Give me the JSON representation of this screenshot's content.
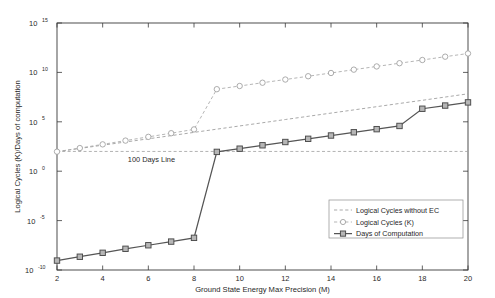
{
  "chart_data": {
    "type": "line",
    "title": "",
    "xlabel": "Ground State Energy Max Precision (M)",
    "ylabel": "Logical Cycles (K)/Days of computation",
    "xlim": [
      2,
      20
    ],
    "ylim": [
      1e-10,
      1000000000000000.0
    ],
    "yscale": "log",
    "xticks": [
      2,
      4,
      6,
      8,
      10,
      12,
      14,
      16,
      18,
      20
    ],
    "xtick_labels": [
      "2",
      "4",
      "6",
      "8",
      "10",
      "12",
      "14",
      "16",
      "18",
      "20"
    ],
    "yticks": [
      1e-10,
      1e-05,
      1,
      100000.0,
      10000000000.0,
      1000000000000000.0
    ],
    "ytick_labels": [
      "10-10",
      "10-5",
      "100",
      "105",
      "1010",
      "1015"
    ],
    "ytick_mantissa": "10",
    "ytick_exponents": [
      "-10",
      "-5",
      "0",
      "5",
      "10",
      "15"
    ],
    "grid": false,
    "legend_position": "lower right",
    "x": [
      2,
      3,
      4,
      5,
      6,
      7,
      8,
      9,
      10,
      11,
      12,
      13,
      14,
      15,
      16,
      17,
      18,
      19,
      20
    ],
    "series": [
      {
        "name": "Logical Cycles without EC",
        "style": "dashed",
        "marker": "none",
        "color": "#9a9a9a",
        "values": [
          95,
          200,
          430,
          900,
          1900,
          4000,
          8500,
          18000,
          38000,
          80000,
          170000,
          360000,
          760000,
          1600000,
          3400000,
          7200000,
          15000000,
          32000000,
          68000000
        ]
      },
      {
        "name": "Logical Cycles (K)",
        "style": "dashed",
        "marker": "circle",
        "color": "#a8a8a8",
        "values": [
          95,
          220,
          520,
          1250,
          3000,
          7000,
          17000,
          200000000.0,
          420000000.0,
          900000000.0,
          1900000000.0,
          4100000000.0,
          8700000000.0,
          19000000000.0,
          40000000000.0,
          85000000000.0,
          180000000000.0,
          390000000000.0,
          820000000000.0
        ]
      },
      {
        "name": "Days of Computation",
        "style": "solid",
        "marker": "square",
        "color": "#555555",
        "values": [
          9e-10,
          2.2e-09,
          5.5e-09,
          1.4e-08,
          3.2e-08,
          7.5e-08,
          1.8e-07,
          90,
          190,
          420,
          900,
          1900,
          4100,
          8700,
          18000,
          38000,
          2100000.0,
          4400000.0,
          9200000.0
        ]
      }
    ],
    "annotations": [
      {
        "text": "100 Days Line",
        "x": 5.1,
        "y": 100,
        "kind": "reference-line-label"
      }
    ],
    "reference_lines": [
      {
        "name": "100 Days Line",
        "orientation": "horizontal",
        "value": 100,
        "style": "dashed"
      }
    ]
  },
  "legend": {
    "items": [
      {
        "label": "Logical Cycles without EC",
        "marker": "none",
        "style": "dashed"
      },
      {
        "label": "Logical Cycles (K)",
        "marker": "circle",
        "style": "dashed"
      },
      {
        "label": "Days of Computation",
        "marker": "square",
        "style": "solid"
      }
    ]
  }
}
